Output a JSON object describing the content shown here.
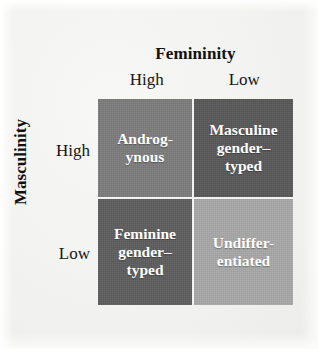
{
  "figure": {
    "background_color": "#f2f2f0",
    "column_axis": {
      "title": "Femininity",
      "levels": [
        "High",
        "Low"
      ]
    },
    "row_axis": {
      "title": "Masculinity",
      "levels": [
        "High",
        "Low"
      ]
    },
    "cells": [
      {
        "id": "androgynous",
        "label": "Androg-\nynous",
        "masculinity": "High",
        "femininity": "High",
        "fill_color": "#7d7d7d",
        "text_color": "#ffffff"
      },
      {
        "id": "masculine-gender-typed",
        "label": "Masculine\ngender–\ntyped",
        "masculinity": "High",
        "femininity": "Low",
        "fill_color": "#595959",
        "text_color": "#ffffff"
      },
      {
        "id": "feminine-gender-typed",
        "label": "Feminine\ngender–\ntyped",
        "masculinity": "Low",
        "femininity": "High",
        "fill_color": "#5e5e5e",
        "text_color": "#ffffff"
      },
      {
        "id": "undifferentiated",
        "label": "Undiffer-\nentiated",
        "masculinity": "Low",
        "femininity": "Low",
        "fill_color": "#a8a8a8",
        "text_color": "#ffffff"
      }
    ]
  }
}
